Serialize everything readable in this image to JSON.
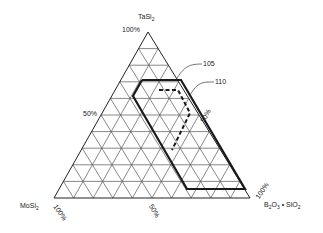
{
  "diagram": {
    "type": "ternary",
    "divisions": 10,
    "vertices": {
      "top": {
        "name": "TaSi2",
        "label_main": "TaSi",
        "label_sub": "2",
        "pct": "100%"
      },
      "left": {
        "name": "MoSi2",
        "label_main": "MoSi",
        "label_sub": "2",
        "pct": "100%"
      },
      "right": {
        "name": "B2O3 • SiO2",
        "pct": "100%"
      }
    },
    "axis_labels": {
      "left_edge_mid": "50%",
      "right_edge_mid": "50%",
      "bottom_edge_mid": "50%"
    },
    "regions": [
      {
        "id": "110",
        "label": "110",
        "style": "solid"
      },
      {
        "id": "105",
        "label": "105",
        "style": "dashed"
      }
    ],
    "colors": {
      "grid": "#555555",
      "outline": "#222222",
      "text": "#222222"
    }
  },
  "chart_data": {
    "type": "ternary",
    "components": [
      "TaSi2",
      "MoSi2",
      "B2O3 • SiO2"
    ],
    "ticks": [
      "0%",
      "50%",
      "100%"
    ],
    "grid_divisions": 10,
    "regions": [
      {
        "name": "110",
        "line": "solid",
        "approx_vertices_px": [
          [
            142,
            80
          ],
          [
            181,
            80
          ],
          [
            245,
            189
          ],
          [
            187,
            189
          ],
          [
            133,
            96
          ]
        ]
      },
      {
        "name": "105",
        "line": "dashed",
        "approx_vertices_px": [
          [
            159,
            90
          ],
          [
            178,
            90
          ],
          [
            190,
            113
          ],
          [
            172,
            150
          ]
        ]
      }
    ]
  }
}
